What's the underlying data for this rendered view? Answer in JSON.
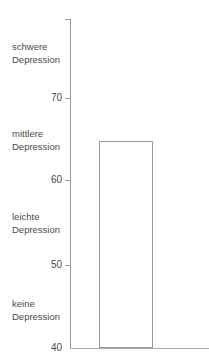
{
  "chart_data": {
    "type": "bar",
    "title": "",
    "subtitle": "",
    "xlabel": "",
    "ylabel": "",
    "categories": [
      ""
    ],
    "values": [
      64.8
    ],
    "ylim": [
      40,
      79.5
    ],
    "grid": false,
    "legend": null,
    "orientation": "vertical",
    "y_ticks": [
      {
        "value": 70,
        "label": "70"
      },
      {
        "value": 60,
        "label": "60"
      },
      {
        "value": 50,
        "label": "50"
      },
      {
        "value": 40,
        "label": "40"
      }
    ],
    "category_annotations": [
      {
        "label": "schwere\nDepression",
        "value": 74.5
      },
      {
        "label": "mittlere\nDepression",
        "value": 64.0
      },
      {
        "label": "leichte\nDepression",
        "value": 54.1
      },
      {
        "label": "keine\nDepression",
        "value": 43.6
      }
    ],
    "series": [
      {
        "name": "",
        "values": [
          64.8
        ]
      }
    ],
    "colors": {
      "bar_fill": "#ffffff",
      "bar_stroke": "#9a9a9a",
      "axis": "#9a9a9a",
      "baseline": "#a8a8a8",
      "text": "#4a4a4a",
      "background": "#ffffff"
    }
  },
  "annotations": {
    "severe_label": "schwere\nDepression",
    "moderate_label": "mittlere\nDepression",
    "mild_label": "leichte\nDepression",
    "none_label": "keine\nDepression"
  },
  "axis": {
    "tick_70": "70",
    "tick_60": "60",
    "tick_50": "50",
    "tick_40": "40"
  }
}
